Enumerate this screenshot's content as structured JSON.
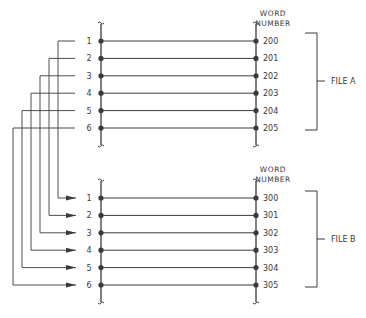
{
  "diagram": {
    "file_a": {
      "label": "FILE A",
      "header": [
        "WORD",
        "NUMBER"
      ],
      "rows": [
        {
          "index": "1",
          "word": "200"
        },
        {
          "index": "2",
          "word": "201"
        },
        {
          "index": "3",
          "word": "202"
        },
        {
          "index": "4",
          "word": "203"
        },
        {
          "index": "5",
          "word": "204"
        },
        {
          "index": "6",
          "word": "205"
        }
      ]
    },
    "file_b": {
      "label": "FILE B",
      "header": [
        "WORD",
        "NUMBER"
      ],
      "rows": [
        {
          "index": "1",
          "word": "300"
        },
        {
          "index": "2",
          "word": "301"
        },
        {
          "index": "3",
          "word": "302"
        },
        {
          "index": "4",
          "word": "303"
        },
        {
          "index": "5",
          "word": "304"
        },
        {
          "index": "6",
          "word": "305"
        }
      ]
    },
    "connections": [
      {
        "from": "A1",
        "to": "B1"
      },
      {
        "from": "A2",
        "to": "B2"
      },
      {
        "from": "A3",
        "to": "B3"
      },
      {
        "from": "A4",
        "to": "B4"
      },
      {
        "from": "A5",
        "to": "B5"
      },
      {
        "from": "A6",
        "to": "B6"
      }
    ],
    "colors": {
      "line": "#3a3a3a",
      "background": "#ffffff"
    }
  }
}
